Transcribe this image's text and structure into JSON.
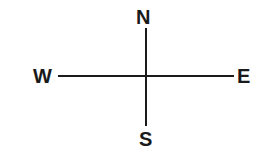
{
  "diagram": {
    "type": "compass-rose-axes",
    "background_color": "#ffffff",
    "stroke_color": "#1a1a1a",
    "label_color": "#1a1a1a",
    "labels": {
      "north": "N",
      "south": "S",
      "west": "W",
      "east": "E"
    },
    "axes": {
      "vertical_name": "north-south-axis",
      "horizontal_name": "west-east-axis"
    }
  }
}
